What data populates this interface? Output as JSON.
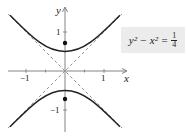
{
  "diagram": {
    "type": "hyperbola-graph",
    "equation": {
      "lhs": "y² − x² =",
      "numerator": "1",
      "denominator": "4"
    },
    "axes": {
      "x_label": "x",
      "y_label": "y",
      "x_ticks": [
        {
          "value": -1,
          "label": "−1"
        },
        {
          "value": 1,
          "label": "1"
        }
      ],
      "y_ticks": [
        {
          "value": 1,
          "label": "1"
        },
        {
          "value": -1,
          "label": "−1"
        }
      ]
    },
    "asymptotes": [
      "y = x",
      "y = −x"
    ],
    "vertices": [
      [
        0,
        0.5
      ],
      [
        0,
        -0.5
      ]
    ],
    "foci": [
      [
        0,
        0.707
      ],
      [
        0,
        -0.707
      ]
    ],
    "colors": {
      "curve": "#222222",
      "asymptote": "#888888",
      "axis": "#777777",
      "equation_box": "#ececec"
    }
  }
}
